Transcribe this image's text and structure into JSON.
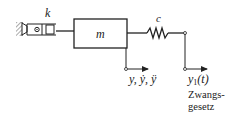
{
  "diagram": {
    "type": "mechanical-schematic",
    "labels": {
      "spring_element": "k",
      "mass": "m",
      "damper_spring": "c",
      "output_motion": "y,  ẏ,  ÿ",
      "input_motion_base": "y",
      "input_motion_sub": "1",
      "input_motion_arg": "(t)",
      "note_line1": "Zwangs-",
      "note_line2": "gesetz"
    },
    "colors": {
      "line": "#222222",
      "background": "#ffffff"
    }
  }
}
